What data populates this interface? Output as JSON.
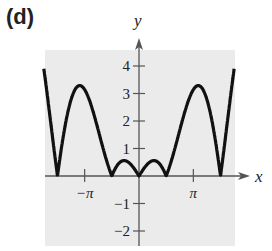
{
  "panel_label": "(d)",
  "colors": {
    "background": "#ebebeb",
    "curve": "#111111",
    "axis": "#555555"
  },
  "chart_data": {
    "type": "line",
    "title": "",
    "xlabel": "x",
    "ylabel": "y",
    "function": "y = |x cos x|",
    "xlim": [
      -5.5,
      5.5
    ],
    "ylim": [
      -2.5,
      4.5
    ],
    "x_ticks": [
      {
        "value": -3.14159,
        "label": "−π"
      },
      {
        "value": 3.14159,
        "label": "π"
      }
    ],
    "y_ticks": [
      {
        "value": 4,
        "label": "4"
      },
      {
        "value": 3,
        "label": "3"
      },
      {
        "value": 2,
        "label": "2"
      },
      {
        "value": 1,
        "label": "1"
      },
      {
        "value": -1,
        "label": "−1"
      },
      {
        "value": -2,
        "label": "−2"
      }
    ],
    "grid": false,
    "series": [
      {
        "name": "curve",
        "x": [
          -5.5,
          -5.0,
          -4.712,
          -4.2,
          -3.8,
          -3.426,
          -3.0,
          -2.5,
          -2.0,
          -1.571,
          -1.2,
          -0.86,
          -0.5,
          0,
          0.5,
          0.86,
          1.2,
          1.571,
          2.0,
          2.5,
          3.0,
          3.426,
          3.8,
          4.2,
          4.712,
          5.0,
          5.5
        ],
        "values": [
          3.88,
          1.42,
          0.0,
          2.05,
          3.0,
          3.29,
          2.97,
          2.0,
          0.83,
          0.0,
          0.43,
          0.56,
          0.44,
          0.0,
          0.44,
          0.56,
          0.43,
          0.0,
          0.83,
          2.0,
          2.97,
          3.29,
          3.0,
          2.05,
          0.0,
          1.42,
          3.88
        ]
      }
    ],
    "key_points": {
      "zeros": [
        -4.712,
        -1.571,
        0,
        1.571,
        4.712
      ],
      "large_peaks": [
        {
          "x": -3.426,
          "y": 3.29
        },
        {
          "x": 3.426,
          "y": 3.29
        }
      ],
      "small_peaks": [
        {
          "x": -0.86,
          "y": 0.56
        },
        {
          "x": 0.86,
          "y": 0.56
        }
      ]
    }
  }
}
